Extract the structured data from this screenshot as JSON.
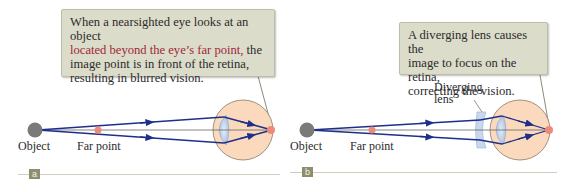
{
  "figure": {
    "panels": [
      {
        "id": "a",
        "badge": "a",
        "callout": {
          "line1": "When a nearsighted eye looks at an object",
          "line2_highlight": "located beyond the eye’s far point,",
          "line2_rest": " the",
          "line3": "image point is in front of the retina,",
          "line4": "resulting in blurred vision."
        },
        "labels": {
          "object": "Object",
          "far_point": "Far point"
        }
      },
      {
        "id": "b",
        "badge": "b",
        "callout": {
          "line1": "A diverging lens causes the",
          "line2": "image to focus on the retina,",
          "line3": "correcting the vision."
        },
        "labels": {
          "object": "Object",
          "far_point": "Far point",
          "lens_line1": "Diverging",
          "lens_line2": "lens"
        }
      }
    ],
    "colors": {
      "ray": "#1e2f8a",
      "eye_fill": "#fbd9bd",
      "eye_stroke": "#8a7a6a",
      "lens_fill": "#b9cde6",
      "object": "#7a7a7a",
      "point": "#ee8a7a",
      "callout_bg": "#dcdcca",
      "highlight_text": "#a0283a"
    }
  }
}
